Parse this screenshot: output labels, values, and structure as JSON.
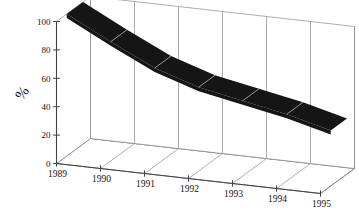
{
  "chart_data": {
    "type": "area",
    "title": "",
    "subtitle": "",
    "xlabel": "",
    "ylabel": "%",
    "categories": [
      "1989",
      "1990",
      "1991",
      "1992",
      "1993",
      "1994",
      "1995"
    ],
    "values": [
      100,
      84,
      69,
      59,
      53,
      47,
      39
    ],
    "series": [
      {
        "name": "",
        "values": [
          100,
          84,
          69,
          59,
          53,
          47,
          39
        ]
      }
    ],
    "ylim": [
      0,
      100
    ],
    "yticks": [
      0,
      20,
      40,
      60,
      80,
      100
    ],
    "ytick_labels": [
      "0",
      "20",
      "40",
      "60",
      "80",
      "100"
    ],
    "grid": true,
    "legend": false,
    "legend_position": "none",
    "projection": "3d-ribbon",
    "series_color": "#151515",
    "axis_color": "#555555",
    "grid_color": "#8a8a8a",
    "background": "#ffffff",
    "annotations": []
  },
  "axes": {
    "y_axis_title": "%",
    "y_tick_labels": [
      "100",
      "80",
      "60",
      "40",
      "20",
      "0"
    ],
    "x_tick_labels": [
      "1989",
      "1990",
      "1991",
      "1992",
      "1993",
      "1994",
      "1995"
    ]
  }
}
